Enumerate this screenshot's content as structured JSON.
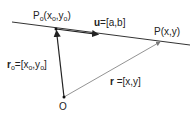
{
  "diagram": {
    "points": {
      "p0": {
        "label": "P",
        "sub": "o",
        "coords": "(x",
        "coords_sub1": "o",
        "coords_mid": ",y",
        "coords_sub2": "o",
        "coords_end": ")"
      },
      "p": {
        "label": "P(x,y)"
      },
      "origin": {
        "label": "O"
      }
    },
    "vectors": {
      "u": {
        "name": "u",
        "value": "=[a,b]"
      },
      "r0": {
        "name": "r",
        "sub": "o",
        "value_start": "=[x",
        "value_sub1": "o",
        "value_mid": ",y",
        "value_sub2": "o",
        "value_end": "]"
      },
      "r": {
        "name": "r",
        "value": " =[x,y]"
      }
    },
    "colors": {
      "line": "#222222",
      "thin_line": "#888888",
      "text": "#222222"
    }
  }
}
